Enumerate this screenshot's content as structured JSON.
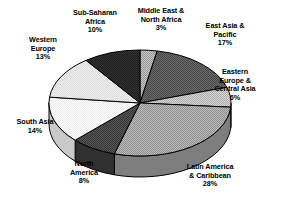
{
  "chart_data": {
    "type": "pie",
    "title": "",
    "subtitle": "",
    "xlabel": "",
    "ylabel": "",
    "legend_position": "none",
    "grid": false,
    "three_d": true,
    "value_unit": "percent",
    "total": 99,
    "categories": [
      "Middle East & North Africa",
      "East Asia & Pacific",
      "Eastern Europe & Central Asia",
      "Latin America & Caribbean",
      "North America",
      "South Asia",
      "Western Europe",
      "Sub-Saharan Africa"
    ],
    "values": [
      3,
      17,
      6,
      28,
      8,
      14,
      13,
      10
    ],
    "slices": [
      {
        "name": "Middle East & North Africa",
        "value": 3,
        "value_label": "3%",
        "label_lines": [
          "Middle East &",
          "North Africa"
        ],
        "fill": "#b0b0b0",
        "side_fill": "#8a8a8a"
      },
      {
        "name": "East Asia & Pacific",
        "value": 17,
        "value_label": "17%",
        "label_lines": [
          "East Asia &",
          "Pacific"
        ],
        "fill": "#595959",
        "side_fill": "#3d3d3d"
      },
      {
        "name": "Eastern Europe & Central Asia",
        "value": 6,
        "value_label": "6%",
        "label_lines": [
          "Eastern",
          "Europe &",
          "Central Asia"
        ],
        "fill": "#c4c4c4",
        "side_fill": "#9a9a9a"
      },
      {
        "name": "Latin America & Caribbean",
        "value": 28,
        "value_label": "28%",
        "label_lines": [
          "Latin America",
          "& Caribbean"
        ],
        "fill": "#a8a8a8",
        "side_fill": "#7e7e7e"
      },
      {
        "name": "North America",
        "value": 8,
        "value_label": "8%",
        "label_lines": [
          "North",
          "America"
        ],
        "fill": "#4a4a4a",
        "side_fill": "#303030"
      },
      {
        "name": "South Asia",
        "value": 14,
        "value_label": "14%",
        "label_lines": [
          "South Asia"
        ],
        "fill": "#f2f2f2",
        "side_fill": "#c9c9c9"
      },
      {
        "name": "Western Europe",
        "value": 13,
        "value_label": "13%",
        "label_lines": [
          "Western",
          "Europe"
        ],
        "fill": "#e4e4e4",
        "side_fill": "#bdbdbd"
      },
      {
        "name": "Sub-Saharan Africa",
        "value": 10,
        "value_label": "10%",
        "label_lines": [
          "Sub-Saharan",
          "Africa"
        ],
        "fill": "#2b2b2b",
        "side_fill": "#161616"
      }
    ],
    "colors": {
      "outline": "#000000",
      "background": "#ffffff",
      "text": "#000000"
    }
  }
}
